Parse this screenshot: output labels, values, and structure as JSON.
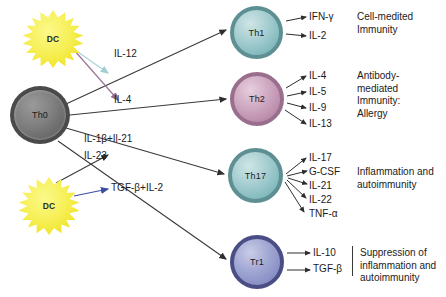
{
  "diagram": {
    "cells": [
      {
        "id": "th0",
        "label": "Th0",
        "color": "#7e7e7e"
      },
      {
        "id": "th1",
        "label": "Th1",
        "color": "#a8cfd2"
      },
      {
        "id": "th2",
        "label": "Th2",
        "color": "#d0aac2"
      },
      {
        "id": "th17",
        "label": "Th17",
        "color": "#a8cfd2"
      },
      {
        "id": "tr1",
        "label": "Tr1",
        "color": "#a3a9d4"
      }
    ],
    "apc": [
      {
        "id": "dc-top",
        "label": "DC",
        "color": "#f6ef55"
      },
      {
        "id": "dc-bottom",
        "label": "DC",
        "color": "#f6ef55"
      }
    ],
    "signals": [
      {
        "id": "il12",
        "label": "IL-12",
        "arrow_color": "#a9d4d8"
      },
      {
        "id": "il4",
        "label": "IL-4",
        "arrow_color": "#9b7496"
      },
      {
        "id": "il1b-il21",
        "label": "IL-1β+Il-21",
        "arrow_color": "#3a3a3a"
      },
      {
        "id": "il23",
        "label": "IL-23",
        "arrow_color": "#3a3a3a"
      },
      {
        "id": "tgfb-il2",
        "label": "TGF-β+IL-2",
        "arrow_color": "#3b4ea0"
      }
    ],
    "branches": [
      {
        "cell": "th1",
        "cytokines": [
          "IFN-γ",
          "IL-2"
        ],
        "outcome": [
          "Cell-medited",
          "Immunity"
        ]
      },
      {
        "cell": "th2",
        "cytokines": [
          "IL-4",
          "IL-5",
          "IL-9",
          "IL-13"
        ],
        "outcome": [
          "Antibody-",
          "mediated",
          "Immunity:",
          "Allergy"
        ]
      },
      {
        "cell": "th17",
        "cytokines": [
          "IL-17",
          "G-CSF",
          "IL-21",
          "IL-22",
          "TNF-α"
        ],
        "outcome": [
          "Inflammation and",
          "autoimmunity"
        ]
      },
      {
        "cell": "tr1",
        "cytokines": [
          "IL-10",
          "TGF-β"
        ],
        "outcome": [
          "Suppression of",
          "inflammation and",
          "autoimmunity"
        ]
      }
    ]
  }
}
